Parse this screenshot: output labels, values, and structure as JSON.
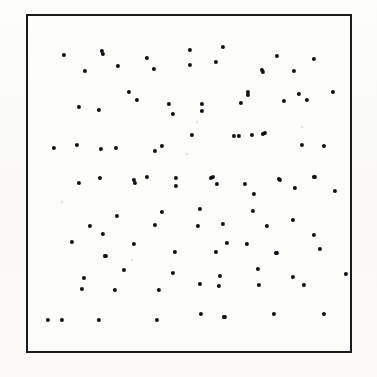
{
  "figure": {
    "title": "Random dot pattern",
    "caption": "",
    "background_color": "#fbfbf9",
    "frame_color": "#1b1b1b",
    "dot_color": "#101010",
    "frame": {
      "x": 26,
      "y": 14,
      "width": 326,
      "height": 339,
      "border_width": 2
    },
    "dot_radius_px": 2.1,
    "dot_count": 108
  },
  "chart_data": {
    "type": "scatter",
    "title": "Random dot pattern",
    "subtitle": "",
    "xlabel": "",
    "ylabel": "",
    "xlim": [
      0,
      326
    ],
    "ylim": [
      0,
      339
    ],
    "grid": false,
    "legend": null,
    "tick_labels_x": [],
    "tick_labels_y": [],
    "annotations": [],
    "series": [
      {
        "name": "dots",
        "marker": "circle",
        "color": "#101010",
        "size_px": 4.2,
        "points": [
          [
            62,
            53
          ],
          [
            100,
            49
          ],
          [
            83,
            69
          ],
          [
            101,
            52
          ],
          [
            145,
            56
          ],
          [
            116,
            64
          ],
          [
            152,
            67
          ],
          [
            188,
            48
          ],
          [
            221,
            45
          ],
          [
            214,
            60
          ],
          [
            188,
            63
          ],
          [
            261,
            70
          ],
          [
            246,
            90
          ],
          [
            275,
            54
          ],
          [
            312,
            57
          ],
          [
            292,
            69
          ],
          [
            260,
            68
          ],
          [
            331,
            90
          ],
          [
            297,
            92
          ],
          [
            305,
            98
          ],
          [
            282,
            99
          ],
          [
            127,
            90
          ],
          [
            135,
            98
          ],
          [
            77,
            105
          ],
          [
            97,
            108
          ],
          [
            167,
            102
          ],
          [
            171,
            112
          ],
          [
            200,
            102
          ],
          [
            239,
            101
          ],
          [
            200,
            109
          ],
          [
            246,
            93
          ],
          [
            52,
            146
          ],
          [
            75,
            143
          ],
          [
            99,
            147
          ],
          [
            114,
            146
          ],
          [
            160,
            144
          ],
          [
            153,
            149
          ],
          [
            190,
            133
          ],
          [
            232,
            134
          ],
          [
            237,
            134
          ],
          [
            250,
            133
          ],
          [
            261,
            132
          ],
          [
            263,
            131
          ],
          [
            300,
            143
          ],
          [
            322,
            144
          ],
          [
            98,
            176
          ],
          [
            77,
            181
          ],
          [
            132,
            178
          ],
          [
            145,
            175
          ],
          [
            133,
            181
          ],
          [
            174,
            176
          ],
          [
            174,
            184
          ],
          [
            209,
            176
          ],
          [
            215,
            182
          ],
          [
            211,
            175
          ],
          [
            243,
            182
          ],
          [
            252,
            192
          ],
          [
            278,
            178
          ],
          [
            313,
            175
          ],
          [
            293,
            186
          ],
          [
            333,
            189
          ],
          [
            277,
            177
          ],
          [
            312,
            175
          ],
          [
            88,
            224
          ],
          [
            101,
            232
          ],
          [
            70,
            240
          ],
          [
            115,
            214
          ],
          [
            160,
            210
          ],
          [
            153,
            223
          ],
          [
            198,
            207
          ],
          [
            251,
            209
          ],
          [
            196,
            224
          ],
          [
            221,
            222
          ],
          [
            265,
            224
          ],
          [
            291,
            218
          ],
          [
            104,
            254
          ],
          [
            132,
            242
          ],
          [
            173,
            250
          ],
          [
            225,
            241
          ],
          [
            245,
            242
          ],
          [
            214,
            250
          ],
          [
            312,
            233
          ],
          [
            318,
            247
          ],
          [
            275,
            251
          ],
          [
            82,
            276
          ],
          [
            80,
            287
          ],
          [
            122,
            268
          ],
          [
            171,
            271
          ],
          [
            113,
            288
          ],
          [
            157,
            288
          ],
          [
            218,
            274
          ],
          [
            256,
            267
          ],
          [
            198,
            282
          ],
          [
            217,
            284
          ],
          [
            257,
            283
          ],
          [
            291,
            275
          ],
          [
            302,
            283
          ],
          [
            344,
            272
          ],
          [
            60,
            318
          ],
          [
            97,
            318
          ],
          [
            155,
            318
          ],
          [
            199,
            312
          ],
          [
            222,
            315
          ],
          [
            272,
            312
          ],
          [
            322,
            312
          ],
          [
            103,
            254
          ],
          [
            274,
            251
          ],
          [
            223,
            315
          ],
          [
            46,
            318
          ]
        ]
      }
    ]
  },
  "specks": [
    {
      "x": 195,
      "y": 120,
      "r": 1.0
    },
    {
      "x": 185,
      "y": 152,
      "r": 0.9
    },
    {
      "x": 130,
      "y": 258,
      "r": 0.9
    },
    {
      "x": 300,
      "y": 125,
      "r": 0.8
    },
    {
      "x": 60,
      "y": 200,
      "r": 0.8
    }
  ]
}
